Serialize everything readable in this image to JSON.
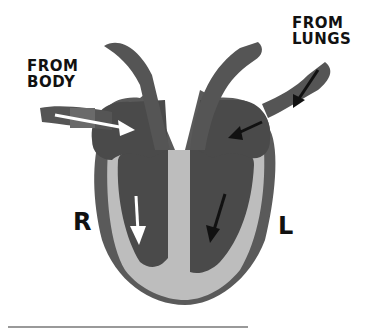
{
  "diagram": {
    "labels": {
      "from_body": [
        "FROM",
        "BODY"
      ],
      "from_lungs": [
        "FROM",
        "LUNGS"
      ],
      "right_side": "R",
      "left_side": "L"
    },
    "colors": {
      "chamber": "#4a4a4a",
      "vessel": "#555555",
      "vessel_band": "#6a6a6a",
      "wall": "#bdbdbd",
      "outer": "#5a5a5a",
      "arrow_right": "#ffffff",
      "arrow_left": "#111111",
      "background": "#ffffff"
    }
  }
}
